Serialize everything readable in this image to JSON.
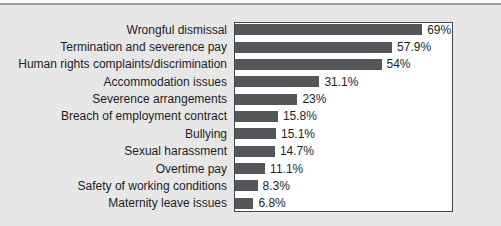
{
  "page": {
    "background_color": "#e7e7e8",
    "top_strip_color": "#fbfbfb",
    "top_rule_color": "#9c9c9c",
    "text_color": "#1d1d1f"
  },
  "chart_data": {
    "type": "bar",
    "orientation": "horizontal",
    "title": "",
    "xlabel": "",
    "ylabel": "",
    "xlim": [
      0,
      80
    ],
    "grid": false,
    "legend": false,
    "plot_background": "#ffffff",
    "plot_border_color": "#454547",
    "bar_color": "#55565a",
    "categories": [
      "Wrongful dismissal",
      "Termination and severence pay",
      "Human rights complaints/discrimination",
      "Accommodation issues",
      "Severence arrangements",
      "Breach of employment contract",
      "Bullying",
      "Sexual harassment",
      "Overtime pay",
      "Safety of working conditions",
      "Maternity leave issues"
    ],
    "values": [
      69,
      57.9,
      54,
      31.1,
      23,
      15.8,
      15.1,
      14.7,
      11.1,
      8.3,
      6.8
    ],
    "value_labels": [
      "69%",
      "57.9%",
      "54%",
      "31.1%",
      "23%",
      "15.8%",
      "15.1%",
      "14.7%",
      "11.1%",
      "8.3%",
      "6.8%"
    ]
  }
}
